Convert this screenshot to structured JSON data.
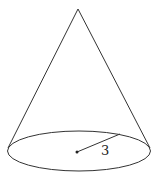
{
  "diagram": {
    "shape": "cone",
    "radius_label": "3",
    "stroke_color": "#333333",
    "background": "#ffffff"
  }
}
